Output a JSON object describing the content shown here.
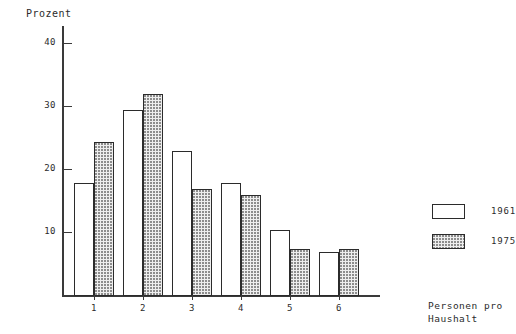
{
  "chart_data": {
    "type": "bar",
    "title": "",
    "ylabel": "Prozent",
    "xlabel": "Personen pro Haushalt",
    "categories": [
      "1",
      "2",
      "3",
      "4",
      "5",
      "6"
    ],
    "yticks": [
      10,
      20,
      30,
      40
    ],
    "ylim": [
      0,
      42
    ],
    "grid": false,
    "legend_position": "right",
    "series": [
      {
        "name": "1961",
        "style": "plain",
        "values": [
          18.0,
          29.5,
          23.0,
          18.0,
          10.5,
          7.0
        ]
      },
      {
        "name": "1975",
        "style": "stippled",
        "values": [
          24.5,
          32.0,
          17.0,
          16.0,
          7.5,
          7.5
        ]
      }
    ]
  },
  "axis": {
    "y_title": "Prozent",
    "tick_labels": [
      "40",
      "30",
      "20",
      "10"
    ]
  },
  "legend": {
    "items": [
      {
        "label": "1961",
        "style": "plain"
      },
      {
        "label": "1975",
        "style": "stippled"
      }
    ]
  },
  "caption": {
    "line1": "Personen pro",
    "line2": "Haushalt"
  },
  "colors": {
    "ink": "#2b2b2b",
    "axis": "#3a3a3a",
    "bar_plain": "#ffffff",
    "bar_stippled": "#eeeeee",
    "stipple_dot": "#8d8d8d"
  }
}
